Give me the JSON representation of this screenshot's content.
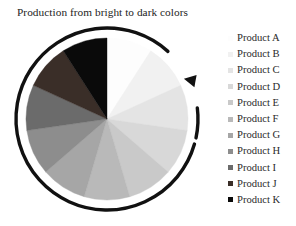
{
  "chart_title": "Production from bright to dark colors",
  "background_color": "#ffffff",
  "arrow": {
    "name": "clockwise-arrow",
    "color": "#111111",
    "description": "circular clockwise arrow surrounding the pie"
  },
  "legend": {
    "position": "right",
    "items": [
      {
        "label": "Product A",
        "color": "#fdfdfd"
      },
      {
        "label": "Product B",
        "color": "#f1f1f1"
      },
      {
        "label": "Product C",
        "color": "#e4e4e4"
      },
      {
        "label": "Product D",
        "color": "#d8d8d8"
      },
      {
        "label": "Product E",
        "color": "#c9c9c9"
      },
      {
        "label": "Product F",
        "color": "#b9b9b9"
      },
      {
        "label": "Product G",
        "color": "#a6a6a6"
      },
      {
        "label": "Product H",
        "color": "#8d8d8d"
      },
      {
        "label": "Product I",
        "color": "#6b6b6b"
      },
      {
        "label": "Product J",
        "color": "#3a2e28"
      },
      {
        "label": "Product K",
        "color": "#0a0a0a"
      }
    ]
  },
  "chart_data": {
    "type": "pie",
    "title": "Production from bright to dark colors",
    "xlabel": "",
    "ylabel": "",
    "start_angle_deg": 90,
    "direction": "clockwise",
    "categories": [
      "Product A",
      "Product B",
      "Product C",
      "Product D",
      "Product E",
      "Product F",
      "Product G",
      "Product H",
      "Product I",
      "Product J",
      "Product K"
    ],
    "values": [
      9.09,
      9.09,
      9.09,
      9.09,
      9.09,
      9.09,
      9.09,
      9.09,
      9.09,
      9.09,
      9.09
    ],
    "value_unit": "percent",
    "colors": [
      "#fdfdfd",
      "#f1f1f1",
      "#e4e4e4",
      "#d8d8d8",
      "#c9c9c9",
      "#b9b9b9",
      "#a6a6a6",
      "#8d8d8d",
      "#6b6b6b",
      "#3a2e28",
      "#0a0a0a"
    ],
    "legend": true,
    "legend_position": "right",
    "grid": false,
    "annotations": [
      "Clockwise circular arrow around the pie indicating ordering from bright to dark"
    ]
  }
}
